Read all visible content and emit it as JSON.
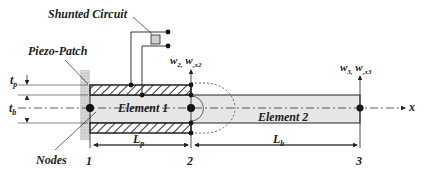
{
  "diagram": {
    "labels": {
      "shunted_circuit": "Shunted Circuit",
      "piezo_patch": "Piezo-Patch",
      "nodes": "Nodes",
      "element1": "Element 1",
      "element2": "Element 2",
      "tp": "t",
      "tp_sub": "p",
      "tb": "t",
      "tb_sub": "b",
      "lp": "L",
      "lp_sub": "p",
      "lb": "L",
      "lb_sub": "b",
      "w2": "w",
      "w2_sub": "2,",
      "wx2": "w",
      "wx2_sub": ",x2",
      "w3": "w",
      "w3_sub": "3,",
      "wx3": "w",
      "wx3_sub": ",x3",
      "x_axis": "x"
    },
    "node_numbers": [
      "1",
      "2",
      "3"
    ],
    "colors": {
      "line": "#222222",
      "beam_fill": "#e6e6e6",
      "wall_fill": "#d8d8d8",
      "resistor_fill": "#d0d0d0"
    }
  }
}
